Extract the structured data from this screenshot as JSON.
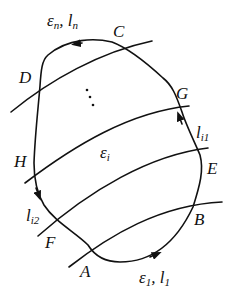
{
  "diagram": {
    "type": "closed-contour-with-level-curves",
    "stroke_color": "#111111",
    "background": "#ffffff",
    "points": {
      "A": "A",
      "B": "B",
      "C": "C",
      "D": "D",
      "E": "E",
      "F": "F",
      "G": "G",
      "H": "H"
    },
    "curve_labels": {
      "top": {
        "eps": "ε",
        "eps_sub": "n",
        "sep": ", ",
        "l": "l",
        "l_sub": "n"
      },
      "bottom": {
        "eps": "ε",
        "eps_sub": "1",
        "sep": ", ",
        "l": "l",
        "l_sub": "1"
      },
      "middle": {
        "eps": "ε",
        "eps_sub": "i"
      },
      "right_arc": {
        "l": "l",
        "l_sub": "i1"
      },
      "left_arc": {
        "l": "l",
        "l_sub": "i2"
      }
    },
    "ellipsis": "⋮",
    "arrows": [
      {
        "name": "arrow-top",
        "direction": "left"
      },
      {
        "name": "arrow-bottom",
        "direction": "right"
      },
      {
        "name": "arrow-right",
        "direction": "up"
      },
      {
        "name": "arrow-left",
        "direction": "down"
      }
    ]
  }
}
